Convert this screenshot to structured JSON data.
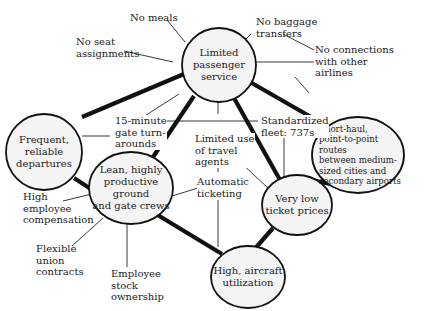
{
  "diagram": {
    "type": "activity-system-map",
    "hubs": {
      "limited_service": "Limited\npassenger\nservice",
      "frequent_departures": "Frequent,\nreliable\ndepartures",
      "short_haul": "Short-haul,\npoint-to-point routes\nbetween medium-\nsized cities and\nsecondary airports",
      "lean_crews": "Lean, highly\nproductive ground\nand gate crews",
      "low_prices": "Very low\nticket prices",
      "aircraft_utilization": "High, aircraft\nutilization"
    },
    "activities": {
      "no_meals": "No meals",
      "no_seat": "No seat\nassignments",
      "no_baggage": "No baggage\ntransfers",
      "no_connections": "No connections\nwith other\nairlines",
      "gate_turnarounds": "15-minute\ngate turn-\narounds",
      "travel_agents": "Limited use\nof travel\nagents",
      "standardized_fleet": "Standardized\nfleet: 737s",
      "automatic_ticketing": "Automatic\nticketing",
      "employee_comp": "High\nemployee\ncompensation",
      "union_contracts": "Flexible\nunion\ncontracts",
      "stock_ownership": "Employee\nstock\nownership"
    },
    "strong_links": [
      [
        "limited_service",
        "frequent_departures"
      ],
      [
        "limited_service",
        "short_haul"
      ],
      [
        "limited_service",
        "lean_crews"
      ],
      [
        "limited_service",
        "low_prices"
      ],
      [
        "frequent_departures",
        "lean_crews"
      ],
      [
        "short_haul",
        "low_prices"
      ],
      [
        "lean_crews",
        "aircraft_utilization"
      ],
      [
        "low_prices",
        "aircraft_utilization"
      ]
    ],
    "colors": {
      "line": "#111111",
      "node_fill": "#f4f4f4",
      "background": "#ffffff"
    }
  }
}
